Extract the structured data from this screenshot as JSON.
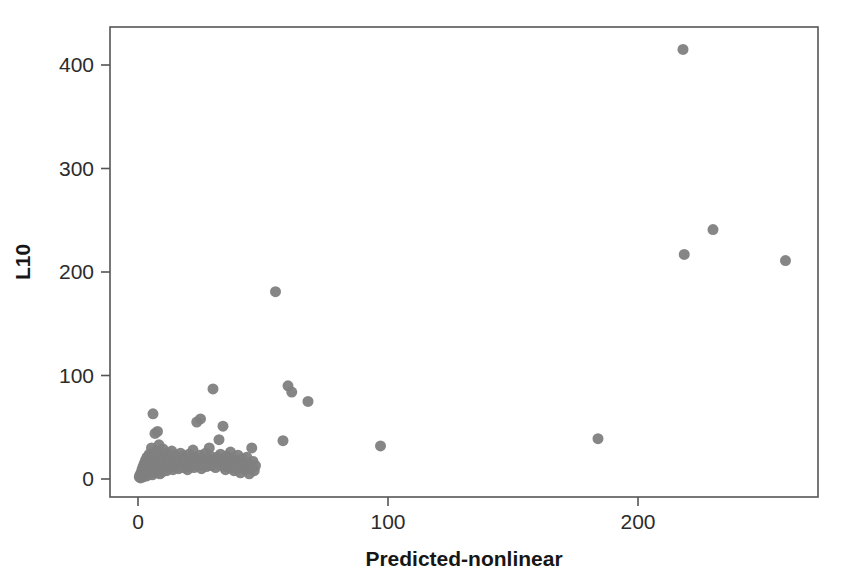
{
  "chart_data": {
    "type": "scatter",
    "title": "",
    "subtitle": "",
    "xlabel": "Predicted-nonlinear",
    "ylabel": "L10",
    "xlim": [
      -13,
      270
    ],
    "ylim": [
      -17,
      445
    ],
    "xticks": [
      0,
      100,
      200
    ],
    "xtick_labels": [
      "0",
      "100",
      "200"
    ],
    "yticks": [
      0,
      100,
      200,
      300,
      400
    ],
    "ytick_labels": [
      "0",
      "100",
      "200",
      "300",
      "400"
    ],
    "grid": false,
    "legend": null,
    "legend_position": "none",
    "marker": {
      "shape": "circle",
      "color": "#808080",
      "radius": 5.5,
      "opacity": 0.95
    },
    "frame": {
      "color": "#555555",
      "width": 1.6,
      "box": true
    },
    "annotations": [],
    "series": [
      {
        "name": "observations",
        "color": "#808080",
        "points": [
          [
            0.5,
            2
          ],
          [
            0.8,
            4
          ],
          [
            1.0,
            1
          ],
          [
            1.2,
            6
          ],
          [
            1.4,
            3
          ],
          [
            1.6,
            9
          ],
          [
            1.8,
            5
          ],
          [
            2.0,
            12
          ],
          [
            2.1,
            2
          ],
          [
            2.3,
            7
          ],
          [
            2.5,
            15
          ],
          [
            2.6,
            4
          ],
          [
            2.8,
            10
          ],
          [
            3.0,
            18
          ],
          [
            3.1,
            6
          ],
          [
            3.3,
            13
          ],
          [
            3.5,
            3
          ],
          [
            3.6,
            21
          ],
          [
            3.8,
            8
          ],
          [
            4.0,
            11
          ],
          [
            4.1,
            16
          ],
          [
            4.3,
            5
          ],
          [
            4.5,
            24
          ],
          [
            4.6,
            9
          ],
          [
            4.8,
            14
          ],
          [
            5.0,
            7
          ],
          [
            5.2,
            19
          ],
          [
            5.4,
            30
          ],
          [
            5.5,
            12
          ],
          [
            5.7,
            4
          ],
          [
            5.9,
            17
          ],
          [
            6.0,
            63
          ],
          [
            6.2,
            10
          ],
          [
            6.4,
            22
          ],
          [
            6.6,
            8
          ],
          [
            6.8,
            44
          ],
          [
            7.0,
            15
          ],
          [
            7.2,
            27
          ],
          [
            7.4,
            6
          ],
          [
            7.6,
            13
          ],
          [
            7.8,
            46
          ],
          [
            8.0,
            20
          ],
          [
            8.2,
            9
          ],
          [
            8.4,
            33
          ],
          [
            8.6,
            16
          ],
          [
            8.8,
            5
          ],
          [
            9.0,
            24
          ],
          [
            9.2,
            12
          ],
          [
            9.5,
            18
          ],
          [
            9.7,
            7
          ],
          [
            10.0,
            29
          ],
          [
            10.2,
            14
          ],
          [
            10.5,
            21
          ],
          [
            10.8,
            10
          ],
          [
            11.0,
            17
          ],
          [
            11.3,
            25
          ],
          [
            11.5,
            8
          ],
          [
            11.8,
            19
          ],
          [
            12.0,
            13
          ],
          [
            12.3,
            22
          ],
          [
            12.6,
            16
          ],
          [
            12.9,
            11
          ],
          [
            13.2,
            20
          ],
          [
            13.5,
            27
          ],
          [
            13.8,
            14
          ],
          [
            14.0,
            9
          ],
          [
            14.3,
            18
          ],
          [
            14.6,
            23
          ],
          [
            15.0,
            12
          ],
          [
            15.3,
            17
          ],
          [
            15.6,
            21
          ],
          [
            16.0,
            15
          ],
          [
            16.3,
            10
          ],
          [
            16.7,
            19
          ],
          [
            17.0,
            25
          ],
          [
            17.4,
            13
          ],
          [
            17.8,
            16
          ],
          [
            18.0,
            22
          ],
          [
            18.4,
            11
          ],
          [
            18.8,
            18
          ],
          [
            19.0,
            14
          ],
          [
            19.4,
            20
          ],
          [
            19.8,
            9
          ],
          [
            20.0,
            17
          ],
          [
            20.4,
            24
          ],
          [
            20.8,
            12
          ],
          [
            21.0,
            19
          ],
          [
            21.5,
            15
          ],
          [
            22.0,
            28
          ],
          [
            22.4,
            11
          ],
          [
            22.8,
            21
          ],
          [
            23.0,
            16
          ],
          [
            23.5,
            55
          ],
          [
            24.0,
            13
          ],
          [
            24.4,
            18
          ],
          [
            24.8,
            23
          ],
          [
            25.0,
            58
          ],
          [
            25.4,
            10
          ],
          [
            25.8,
            17
          ],
          [
            26.0,
            20
          ],
          [
            26.5,
            14
          ],
          [
            27.0,
            25
          ],
          [
            27.4,
            12
          ],
          [
            27.8,
            19
          ],
          [
            28.0,
            16
          ],
          [
            28.5,
            30
          ],
          [
            29.0,
            22
          ],
          [
            29.4,
            13
          ],
          [
            29.8,
            18
          ],
          [
            30.0,
            87
          ],
          [
            30.5,
            15
          ],
          [
            31.0,
            11
          ],
          [
            31.5,
            21
          ],
          [
            32.0,
            17
          ],
          [
            32.4,
            38
          ],
          [
            32.8,
            14
          ],
          [
            33.0,
            24
          ],
          [
            33.5,
            19
          ],
          [
            34.0,
            51
          ],
          [
            34.4,
            12
          ],
          [
            34.8,
            16
          ],
          [
            35.0,
            9
          ],
          [
            35.5,
            22
          ],
          [
            36.0,
            14
          ],
          [
            36.4,
            18
          ],
          [
            36.8,
            11
          ],
          [
            37.0,
            26
          ],
          [
            37.5,
            15
          ],
          [
            38.0,
            20
          ],
          [
            38.4,
            8
          ],
          [
            38.8,
            17
          ],
          [
            39.0,
            13
          ],
          [
            39.5,
            10
          ],
          [
            40.0,
            23
          ],
          [
            40.5,
            16
          ],
          [
            41.0,
            6
          ],
          [
            41.5,
            19
          ],
          [
            42.0,
            12
          ],
          [
            42.5,
            15
          ],
          [
            43.0,
            9
          ],
          [
            43.5,
            21
          ],
          [
            44.0,
            14
          ],
          [
            44.5,
            5
          ],
          [
            45.0,
            11
          ],
          [
            45.5,
            30
          ],
          [
            46.0,
            17
          ],
          [
            46.5,
            8
          ],
          [
            47.0,
            13
          ],
          [
            55.0,
            181
          ],
          [
            58.0,
            37
          ],
          [
            60.0,
            90
          ],
          [
            61.5,
            84
          ],
          [
            68.0,
            75
          ],
          [
            97.0,
            32
          ],
          [
            184.0,
            39
          ],
          [
            218.0,
            415
          ],
          [
            218.5,
            217
          ],
          [
            230.0,
            241
          ],
          [
            259.0,
            211
          ]
        ]
      }
    ]
  },
  "axes": {
    "x_title": "Predicted-nonlinear",
    "y_title": "L10"
  }
}
